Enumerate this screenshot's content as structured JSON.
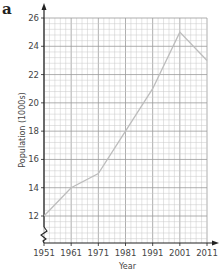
{
  "panel_label": "a",
  "chart_data": {
    "type": "line",
    "title": "",
    "xlabel": "Year",
    "ylabel": "Population (1000s)",
    "x": [
      1951,
      1961,
      1971,
      1981,
      1991,
      2001,
      2011
    ],
    "categories": [
      "1951",
      "1961",
      "1971",
      "1981",
      "1991",
      "2001",
      "2011"
    ],
    "series": [
      {
        "name": "Population (1000s)",
        "values": [
          12,
          14,
          15,
          18,
          21,
          25,
          23
        ]
      }
    ],
    "xlim": [
      1951,
      2011
    ],
    "ylim": [
      12,
      26
    ],
    "y_ticks": [
      "12",
      "14",
      "16",
      "18",
      "20",
      "22",
      "24",
      "26"
    ],
    "x_ticks": [
      "1951",
      "1961",
      "1971",
      "1981",
      "1991",
      "2001",
      "2011"
    ],
    "grid": true,
    "axis_break": "zigzag on y-axis below 12",
    "line_color": "#bdbdbd",
    "grid_color": "#c8c8c8"
  }
}
